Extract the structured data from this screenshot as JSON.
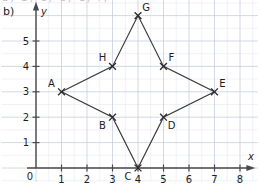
{
  "figure": {
    "part_label": "b)",
    "clipped_top_text": "a) b) c) d) e) f)"
  },
  "chart_data": {
    "type": "scatter",
    "title": "",
    "xlabel": "x",
    "ylabel": "y",
    "xlim": [
      0,
      8.6
    ],
    "ylim": [
      0,
      6.5
    ],
    "grid": true,
    "grid_minor_step": 0.5,
    "legend": "none",
    "origin_label": "0",
    "xticks": [
      1,
      2,
      3,
      4,
      5,
      6,
      7,
      8
    ],
    "yticks": [
      1,
      2,
      3,
      4,
      5
    ],
    "points": [
      {
        "label": "A",
        "x": 1,
        "y": 3,
        "label_pos": "up-left"
      },
      {
        "label": "B",
        "x": 3,
        "y": 2,
        "label_pos": "down-left"
      },
      {
        "label": "C",
        "x": 4,
        "y": 0,
        "label_pos": "down-left"
      },
      {
        "label": "D",
        "x": 5,
        "y": 2,
        "label_pos": "down-right"
      },
      {
        "label": "E",
        "x": 7,
        "y": 3,
        "label_pos": "up-right"
      },
      {
        "label": "F",
        "x": 5,
        "y": 4,
        "label_pos": "up-right"
      },
      {
        "label": "G",
        "x": 4,
        "y": 6,
        "label_pos": "up-right"
      },
      {
        "label": "H",
        "x": 3,
        "y": 4,
        "label_pos": "up-left"
      }
    ],
    "polygon_order": [
      "A",
      "H",
      "G",
      "F",
      "E",
      "D",
      "C",
      "B"
    ],
    "shape": "eight-pointed star outline",
    "annotations": []
  },
  "colors": {
    "axis": "#4a4a4a",
    "grid_major": "#c8cedd",
    "grid_minor": "#e6eaf2",
    "series_line": "#3a3a3a",
    "marker": "#2b2b2b",
    "text": "#1d1d1d",
    "background": "#ffffff"
  }
}
